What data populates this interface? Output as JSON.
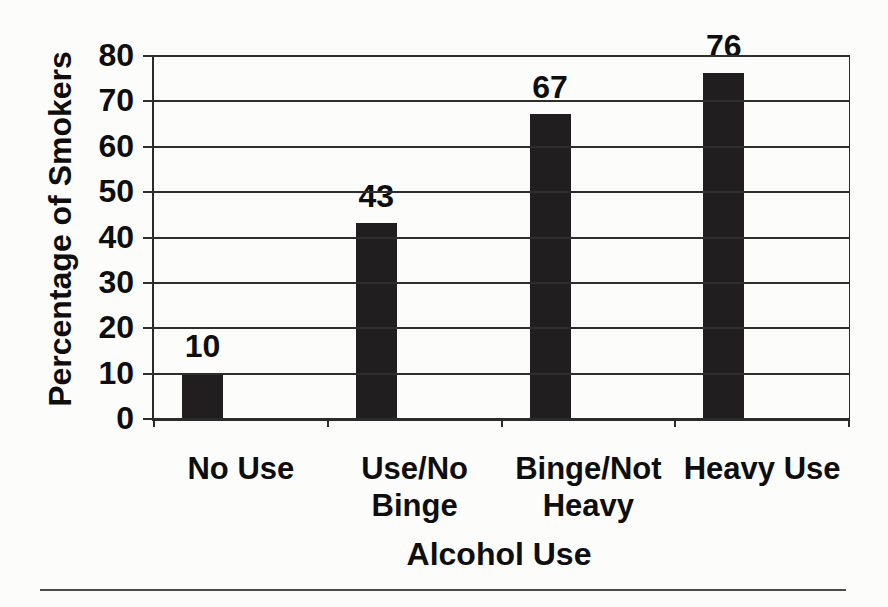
{
  "page": {
    "background": "#fcfcfa"
  },
  "chart_data": {
    "type": "bar",
    "title": "",
    "xlabel": "Alcohol Use",
    "ylabel": "Percentage of Smokers",
    "categories": [
      "No Use",
      "Use/No Binge",
      "Binge/Not Heavy",
      "Heavy Use"
    ],
    "values": [
      10,
      43,
      67,
      76
    ],
    "ylim": [
      0,
      80
    ],
    "yticks": [
      0,
      10,
      20,
      30,
      40,
      50,
      60,
      70,
      80
    ],
    "grid": true,
    "legend": "none",
    "colors": {
      "bar": "#201e1e",
      "axis": "#2b2b2b",
      "grid": "#2e2e2e",
      "text": "#0e0e0e",
      "rule": "#4a4a4a"
    }
  }
}
